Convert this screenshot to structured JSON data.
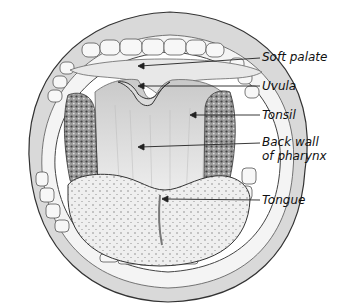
{
  "diagram": {
    "labels": [
      {
        "id": "soft-palate",
        "text": "Soft palate",
        "x": 262,
        "y": 51
      },
      {
        "id": "uvula",
        "text": "Uvula",
        "x": 262,
        "y": 80
      },
      {
        "id": "tonsil",
        "text": "Tonsil",
        "x": 262,
        "y": 110
      },
      {
        "id": "back-wall",
        "text": "Back wall",
        "x": 262,
        "y": 136
      },
      {
        "id": "back-wall-2",
        "text": "of pharynx",
        "x": 262,
        "y": 150
      },
      {
        "id": "tongue",
        "text": "Tongue",
        "x": 262,
        "y": 195
      }
    ],
    "colors": {
      "ink": "#222222",
      "shade": "#8a8a8a",
      "light": "#e6e6e6",
      "background": "#ffffff"
    }
  }
}
